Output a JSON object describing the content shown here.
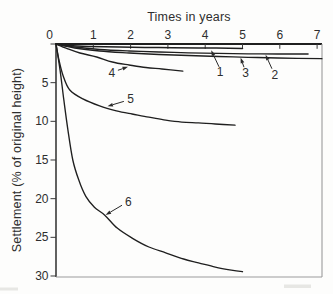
{
  "chart_data": {
    "type": "line",
    "title": "",
    "xlabel": "Times in years",
    "ylabel": "Settlement (% of original height)",
    "x_axis_side": "top",
    "y_direction": "down",
    "xlim": [
      0,
      7.13
    ],
    "ylim": [
      0,
      30
    ],
    "grid": false,
    "legend": "none",
    "x_ticks": [
      {
        "v": 0,
        "label": "0"
      },
      {
        "v": 1,
        "label": "1"
      },
      {
        "v": 2,
        "label": "2"
      },
      {
        "v": 3,
        "label": "3"
      },
      {
        "v": 4,
        "label": "4"
      },
      {
        "v": 5,
        "label": "5"
      },
      {
        "v": 6,
        "label": "6"
      },
      {
        "v": 7,
        "label": "7"
      }
    ],
    "y_ticks": [
      {
        "v": 0,
        "label": ""
      },
      {
        "v": 5,
        "label": "5"
      },
      {
        "v": 10,
        "label": "10"
      },
      {
        "v": 15,
        "label": "15"
      },
      {
        "v": 20,
        "label": "20"
      },
      {
        "v": 25,
        "label": "25"
      },
      {
        "v": 30,
        "label": "30"
      }
    ],
    "series": [
      {
        "name": "1",
        "points": [
          [
            0,
            0
          ],
          [
            0.37,
            0.2
          ],
          [
            0.9,
            0.32
          ],
          [
            1.7,
            0.4
          ],
          [
            2.76,
            0.46
          ],
          [
            3.82,
            0.5
          ],
          [
            5.0,
            0.57
          ]
        ]
      },
      {
        "name": "2",
        "points": [
          [
            0,
            0
          ],
          [
            0.5,
            0.52
          ],
          [
            1.17,
            0.91
          ],
          [
            1.96,
            1.16
          ],
          [
            2.76,
            1.36
          ],
          [
            3.55,
            1.49
          ],
          [
            4.35,
            1.62
          ],
          [
            5.15,
            1.72
          ],
          [
            5.94,
            1.81
          ],
          [
            7.13,
            1.9
          ]
        ]
      },
      {
        "name": "3",
        "points": [
          [
            0,
            0
          ],
          [
            0.5,
            0.39
          ],
          [
            1.17,
            0.71
          ],
          [
            1.96,
            0.91
          ],
          [
            2.76,
            1.03
          ],
          [
            3.55,
            1.14
          ],
          [
            4.35,
            1.2
          ],
          [
            5.15,
            1.27
          ],
          [
            5.94,
            1.29
          ],
          [
            6.76,
            1.29
          ]
        ]
      },
      {
        "name": "4",
        "points": [
          [
            0,
            0
          ],
          [
            0.3,
            0.6
          ],
          [
            0.64,
            1.16
          ],
          [
            1.09,
            1.68
          ],
          [
            1.51,
            2.33
          ],
          [
            1.96,
            2.72
          ],
          [
            2.41,
            3.04
          ],
          [
            2.84,
            3.23
          ],
          [
            3.4,
            3.5
          ]
        ]
      },
      {
        "name": "5",
        "points": [
          [
            0,
            0
          ],
          [
            0.08,
            2.1
          ],
          [
            0.19,
            4.1
          ],
          [
            0.37,
            5.95
          ],
          [
            0.72,
            7.1
          ],
          [
            1.17,
            8.0
          ],
          [
            1.62,
            8.65
          ],
          [
            2.04,
            9.05
          ],
          [
            2.49,
            9.45
          ],
          [
            2.94,
            9.85
          ],
          [
            3.37,
            10.1
          ],
          [
            3.82,
            10.2
          ],
          [
            4.27,
            10.35
          ],
          [
            4.8,
            10.5
          ]
        ]
      },
      {
        "name": "6",
        "points": [
          [
            0,
            0
          ],
          [
            0.11,
            3.4
          ],
          [
            0.21,
            7.2
          ],
          [
            0.32,
            11.1
          ],
          [
            0.45,
            15.0
          ],
          [
            0.61,
            17.6
          ],
          [
            0.8,
            19.7
          ],
          [
            1.03,
            21.1
          ],
          [
            1.3,
            22.1
          ],
          [
            1.64,
            23.8
          ],
          [
            2.04,
            25.1
          ],
          [
            2.49,
            26.25
          ],
          [
            2.94,
            27.0
          ],
          [
            3.42,
            27.8
          ],
          [
            3.82,
            28.3
          ],
          [
            4.27,
            28.85
          ],
          [
            4.7,
            29.25
          ],
          [
            5.0,
            29.45
          ]
        ]
      }
    ],
    "annotations": [
      {
        "label": "1",
        "label_at": [
          4.4,
          3.56
        ],
        "arrow_from": [
          4.37,
          2.95
        ],
        "arrow_tip": [
          4.16,
          0.8
        ]
      },
      {
        "label": "2",
        "label_at": [
          5.87,
          4.0
        ],
        "arrow_from": [
          5.79,
          3.2
        ],
        "arrow_tip": [
          5.62,
          1.4
        ]
      },
      {
        "label": "3",
        "label_at": [
          5.08,
          3.69
        ],
        "arrow_from": [
          5.04,
          3.0
        ],
        "arrow_tip": [
          4.95,
          1.78
        ]
      },
      {
        "label": "4",
        "label_at": [
          1.5,
          3.69
        ],
        "arrow_from": [
          1.66,
          3.4
        ],
        "arrow_tip": [
          1.93,
          2.95
        ]
      },
      {
        "label": "5",
        "label_at": [
          2.0,
          7.05
        ],
        "arrow_from": [
          1.82,
          7.42
        ],
        "arrow_tip": [
          1.38,
          8.05
        ]
      },
      {
        "label": "6",
        "label_at": [
          1.94,
          20.4
        ],
        "arrow_from": [
          1.77,
          20.85
        ],
        "arrow_tip": [
          1.33,
          22.1
        ]
      }
    ],
    "colors": {
      "curve": "#1f1f1f",
      "axis": "#1f1f1f",
      "frame_light": "#9b9b9b",
      "text": "#2e2e2e"
    }
  }
}
